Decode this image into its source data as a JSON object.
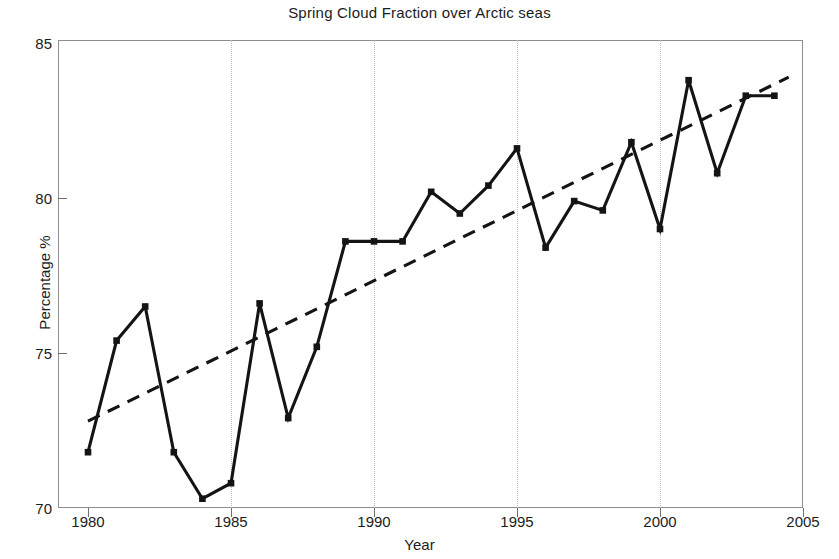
{
  "chart_data": {
    "type": "line",
    "title": "Spring  Cloud Fraction over Arctic seas",
    "xlabel": "Year",
    "ylabel": "Percentage %",
    "xlim": [
      1980,
      2005
    ],
    "ylim": [
      70,
      85
    ],
    "xticks": [
      1980,
      1985,
      1990,
      1995,
      2000,
      2005
    ],
    "yticks": [
      70,
      75,
      80,
      85
    ],
    "grid": "vertical-dotted",
    "legend": "none",
    "x": [
      1980,
      1981,
      1982,
      1983,
      1984,
      1985,
      1986,
      1987,
      1988,
      1989,
      1990,
      1991,
      1992,
      1993,
      1994,
      1995,
      1996,
      1997,
      1998,
      1999,
      2000,
      2001,
      2002,
      2003,
      2004
    ],
    "series": [
      {
        "name": "Spring cloud fraction",
        "style": "solid-with-square-markers",
        "color": "#141414",
        "values": [
          71.8,
          75.4,
          76.5,
          71.8,
          70.3,
          70.8,
          76.6,
          72.9,
          75.2,
          78.6,
          78.6,
          78.6,
          80.2,
          79.5,
          80.4,
          81.6,
          78.4,
          79.9,
          79.6,
          81.8,
          79.0,
          83.8,
          80.8,
          83.3,
          83.3
        ]
      },
      {
        "name": "Linear trend",
        "style": "dashed",
        "color": "#141414",
        "x": [
          1980,
          2004.5
        ],
        "values": [
          72.8,
          83.9
        ]
      }
    ]
  }
}
